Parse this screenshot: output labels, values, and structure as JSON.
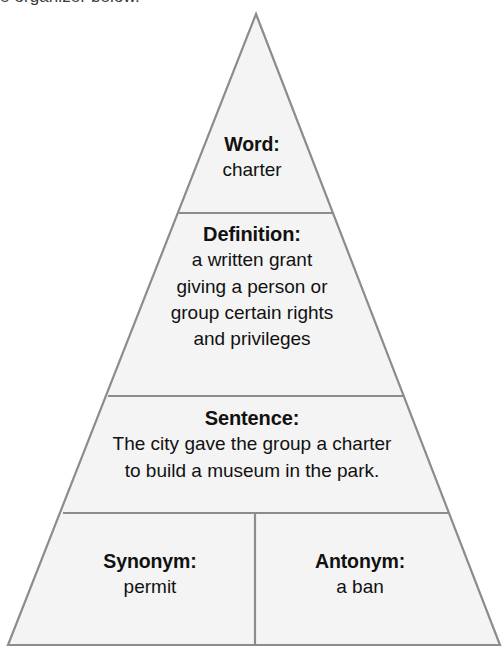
{
  "page": {
    "instruction_text": "e organizer below."
  },
  "colors": {
    "stroke": "#8c8c8c",
    "fill": "#f4f4f4",
    "text": "#111111",
    "instruction_text": "#3c3c3c",
    "background": "#ffffff"
  },
  "organizer": {
    "type": "pyramid",
    "sections": [
      {
        "id": "word",
        "heading": "Word:",
        "body": "charter"
      },
      {
        "id": "definition",
        "heading": "Definition:",
        "body": "a written grant\ngiving a person or\ngroup certain rights\nand privileges",
        "lines": [
          "a written grant",
          "giving a person or",
          "group certain rights",
          "and privileges"
        ]
      },
      {
        "id": "sentence",
        "heading": "Sentence:",
        "body": "The city gave the group a charter\nto build a museum in the park.",
        "lines": [
          "The city gave the group a charter",
          "to build a museum in the park."
        ]
      },
      {
        "id": "synonym",
        "heading": "Synonym:",
        "body": "permit"
      },
      {
        "id": "antonym",
        "heading": "Antonym:",
        "body": "a ban"
      }
    ]
  },
  "geometry": {
    "apex_x": 256,
    "apex_y": 14,
    "base_y": 645,
    "base_left_x": 8,
    "base_right_x": 500,
    "divider_y": [
      213,
      396,
      513
    ],
    "vertical_divider_x": 255
  }
}
